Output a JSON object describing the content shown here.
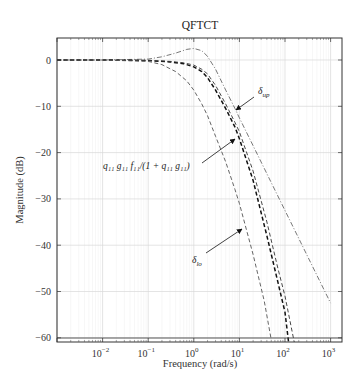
{
  "chart_data": {
    "type": "line",
    "title": "QFTCT",
    "xlabel": "Frequency (rad/s)",
    "ylabel": "Magnitude (dB)",
    "xscale": "log",
    "xlim": [
      0.001,
      1800
    ],
    "ylim": [
      -61,
      5
    ],
    "grid": true,
    "legend": "none",
    "x_ticks": [
      {
        "value": 0.01,
        "label_base": "10",
        "label_exp": "-2"
      },
      {
        "value": 0.1,
        "label_base": "10",
        "label_exp": "-1"
      },
      {
        "value": 1,
        "label_base": "10",
        "label_exp": "0"
      },
      {
        "value": 10,
        "label_base": "10",
        "label_exp": "1"
      },
      {
        "value": 100,
        "label_base": "10",
        "label_exp": "2"
      },
      {
        "value": 1000,
        "label_base": "10",
        "label_exp": "3"
      }
    ],
    "y_ticks": [
      0,
      -10,
      -20,
      -30,
      -40,
      -50,
      -60
    ],
    "y_tick_labels": [
      "0",
      "−10",
      "−20",
      "−30",
      "−40",
      "−50",
      "−60"
    ],
    "series": [
      {
        "name": "delta_up",
        "style": "dashdot",
        "color": "#555555",
        "x": [
          0.001,
          0.01,
          0.1,
          0.2,
          0.4,
          0.7,
          1,
          1.5,
          2,
          3,
          5,
          8,
          10,
          20,
          50,
          100,
          200,
          500,
          1000
        ],
        "y": [
          0,
          0,
          0.2,
          0.7,
          1.5,
          2.3,
          2.5,
          2.0,
          0.8,
          -2,
          -6.5,
          -10.5,
          -12.5,
          -18.5,
          -26.5,
          -32.5,
          -38.5,
          -46.5,
          -52.5
        ]
      },
      {
        "name": "nominal q11 g11 f11/(1+q11 g11)",
        "style": "dashed-thick",
        "color": "#111111",
        "x": [
          0.001,
          0.01,
          0.1,
          0.3,
          0.6,
          1,
          1.5,
          2,
          3,
          5,
          8,
          10,
          20,
          40,
          70,
          100,
          120
        ],
        "y": [
          0,
          0,
          -0.1,
          -0.4,
          -0.8,
          -1.5,
          -2.5,
          -3.8,
          -6.5,
          -10.5,
          -14.5,
          -17,
          -26,
          -38,
          -48,
          -54.5,
          -61
        ]
      },
      {
        "name": "nominal-upper",
        "style": "dashed",
        "color": "#333333",
        "x": [
          0.001,
          0.01,
          0.1,
          0.3,
          0.6,
          1,
          1.5,
          2,
          3,
          5,
          8,
          10,
          20,
          40,
          70,
          100,
          160
        ],
        "y": [
          0,
          0,
          -0.1,
          -0.3,
          -0.6,
          -1.1,
          -2,
          -3,
          -5.5,
          -9.5,
          -13.5,
          -15.5,
          -24,
          -35,
          -45,
          -51,
          -61
        ]
      },
      {
        "name": "delta_lo",
        "style": "dashed",
        "color": "#555555",
        "x": [
          0.001,
          0.01,
          0.1,
          0.2,
          0.4,
          0.7,
          1,
          1.5,
          2,
          3,
          5,
          8,
          10,
          20,
          35,
          50
        ],
        "y": [
          0,
          0,
          -0.3,
          -1,
          -2.5,
          -4.5,
          -6.5,
          -9.5,
          -12,
          -16.5,
          -22,
          -28,
          -31,
          -42,
          -52,
          -60.5
        ]
      }
    ],
    "annotations": [
      {
        "id": "delta-up",
        "text_main": "δ",
        "text_sub": "up",
        "text_x": 258,
        "text_y": 94,
        "arrow_from": [
          254,
          97
        ],
        "arrow_to": [
          236,
          110
        ]
      },
      {
        "id": "nominal",
        "text_main": "q₁₁ g₁₁ f₁₁/(1 + q₁₁ g₁₁)",
        "text_sub": "",
        "text_x": 103,
        "text_y": 169,
        "arrow_from": [
          202,
          163
        ],
        "arrow_to": [
          235,
          139
        ]
      },
      {
        "id": "delta-lo",
        "text_main": "δ",
        "text_sub": "lo",
        "text_x": 192,
        "text_y": 263,
        "arrow_from": [
          206,
          253
        ],
        "arrow_to": [
          242,
          229
        ]
      }
    ]
  },
  "labels": {
    "title": "QFTCT",
    "xlabel": "Frequency (rad/s)",
    "ylabel": "Magnitude (dB)"
  }
}
